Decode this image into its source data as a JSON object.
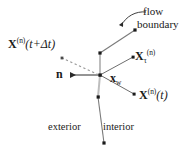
{
  "figure": {
    "width": 194,
    "height": 149,
    "background_color": "#ffffff",
    "ink_color": "#1a1a1a",
    "boundary_color": "#b4b4b4",
    "ray_color": "#6e6e6e",
    "trail_color": "#9a9a9a"
  },
  "labels": {
    "x_next_base": "X",
    "x_next_sup": "(n)",
    "x_next_arg": "(t+Δt)",
    "flow": "flow",
    "boundary": "boundary",
    "x_tau_base": "X",
    "x_tau_sub": "τ",
    "x_tau_sup": "(n)",
    "x_t_base": "X",
    "x_t_sup": "(n)",
    "x_t_arg": "(t)",
    "normal": "n",
    "xw_base": "x",
    "xw_sub": "w",
    "exterior": "exterior",
    "interior": "interior"
  },
  "geometry": {
    "hub": {
      "x": 100,
      "y": 75
    },
    "boundary_polyline": [
      {
        "x": 135,
        "y": 30
      },
      {
        "x": 100,
        "y": 53
      },
      {
        "x": 100,
        "y": 75
      },
      {
        "x": 98,
        "y": 97
      },
      {
        "x": 104,
        "y": 143
      }
    ],
    "boundary_vertices": [
      {
        "x": 135,
        "y": 30
      },
      {
        "x": 100,
        "y": 53
      },
      {
        "x": 100,
        "y": 75
      },
      {
        "x": 98,
        "y": 97
      },
      {
        "x": 104,
        "y": 143
      }
    ],
    "ray_to_x_tau": {
      "x": 133,
      "y": 57
    },
    "ray_to_x_t": {
      "x": 134,
      "y": 94
    },
    "normal_arrow_tip": {
      "x": 70,
      "y": 75
    },
    "trail_start": {
      "x": 62,
      "y": 58
    },
    "trail_end": {
      "x": 97,
      "y": 74
    },
    "leader_start": {
      "x": 146,
      "y": 12
    },
    "leader_tip": {
      "x": 121,
      "y": 26
    }
  }
}
